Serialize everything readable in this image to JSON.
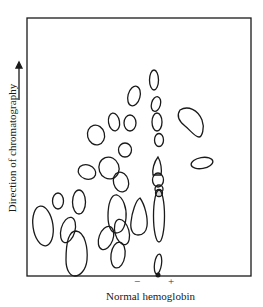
{
  "figure": {
    "y_axis_label": "Direction of chromatography",
    "x_axis_label": "Normal hemoglobin",
    "polarity_minus": "−",
    "polarity_plus": "+",
    "arrow_direction": "up",
    "stroke_color": "#1a1a1a",
    "background": "#ffffff"
  },
  "spots": {
    "count": 33,
    "origin_marker": "filled dot at baseline near + / − divider"
  }
}
